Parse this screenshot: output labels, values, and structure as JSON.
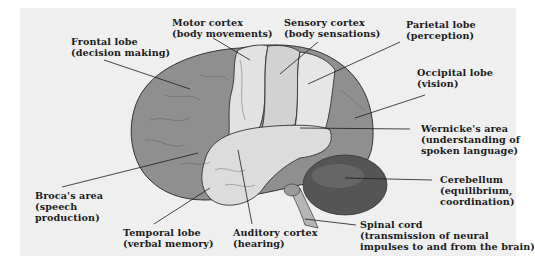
{
  "diagram": {
    "type": "anatomical-labeled-illustration",
    "colors": {
      "background": "#ffffff",
      "panel": "#efefef",
      "dark_lobe": "#8f8f8f",
      "light_cortex": "#dcdcdc",
      "cerebellum": "#555555",
      "leader_line": "#1a1a1a",
      "text": "#1a1a1a"
    },
    "labels": [
      {
        "id": "frontal",
        "name": "Frontal lobe",
        "function": "(decision making)"
      },
      {
        "id": "motor",
        "name": "Motor cortex",
        "function": "(body movements)"
      },
      {
        "id": "sensory",
        "name": "Sensory cortex",
        "function": "(body sensations)"
      },
      {
        "id": "parietal",
        "name": "Parietal lobe",
        "function": "(perception)"
      },
      {
        "id": "occipital",
        "name": "Occipital lobe",
        "function": "(vision)"
      },
      {
        "id": "wernicke",
        "name": "Wernicke's area",
        "function": "(understanding of",
        "function2": "spoken language)"
      },
      {
        "id": "cerebellum",
        "name": "Cerebellum",
        "function": "(equilibrium,",
        "function2": "coordination)"
      },
      {
        "id": "spinal",
        "name": "Spinal cord",
        "function": "(transmission of neural",
        "function2": "impulses to and from the brain)"
      },
      {
        "id": "auditory",
        "name": "Auditory cortex",
        "function": "(hearing)"
      },
      {
        "id": "temporal",
        "name": "Temporal lobe",
        "function": "(verbal memory)"
      },
      {
        "id": "broca",
        "name": "Broca's area",
        "function": "(speech",
        "function2": "production)"
      }
    ]
  }
}
